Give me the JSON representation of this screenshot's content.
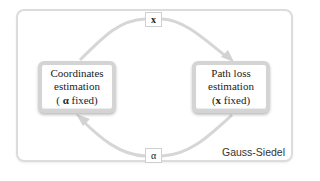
{
  "diagram": {
    "type": "iterative-loop",
    "frame_label": "Gauss-Siedel",
    "nodes": [
      {
        "id": "coordinates",
        "lines": [
          "Coordinates",
          "estimation"
        ],
        "condition_prefix": "( ",
        "condition_symbol": "α",
        "condition_suffix": " fixed)"
      },
      {
        "id": "path-loss",
        "lines": [
          "Path loss",
          "estimation"
        ],
        "condition_prefix": "(",
        "condition_symbol": "x",
        "condition_suffix": " fixed)"
      }
    ],
    "edges": [
      {
        "from": "coordinates",
        "to": "path-loss",
        "label": "x",
        "route": "top"
      },
      {
        "from": "path-loss",
        "to": "coordinates",
        "label": "α",
        "route": "bottom"
      }
    ],
    "colors": {
      "arrow": "#d6d6d6",
      "frame": "#dcdcdc",
      "box_border": "#d4d4d4",
      "text": "#222222"
    }
  }
}
